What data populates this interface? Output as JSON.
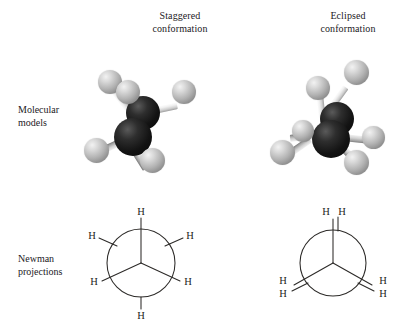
{
  "figure": {
    "title_staggered_line1": "Staggered",
    "title_staggered_line2": "conformation",
    "title_eclipsed_line1": "Eclipsed",
    "title_eclipsed_line2": "conformation",
    "row_label_models_line1": "Molecular",
    "row_label_models_line2": "models",
    "row_label_newman_line1": "Newman",
    "row_label_newman_line2": "projections",
    "background_color": "#ffffff",
    "text_color": "#23201e",
    "line_color": "#2c2a28",
    "carbon_color": "#131313",
    "hydrogen_color": "#b3b3b3"
  },
  "newman_staggered": {
    "front_h_labels": [
      "H",
      "H",
      "H"
    ],
    "back_h_labels": [
      "H",
      "H",
      "H"
    ],
    "h_top": "H",
    "h_upper_left": "H",
    "h_upper_right": "H",
    "h_lower_left": "H",
    "h_lower_right": "H",
    "h_bottom": "H",
    "dihedral_angle_deg": 60
  },
  "newman_eclipsed": {
    "h_top_left": "H",
    "h_top_right": "H",
    "h_left_upper": "H",
    "h_left_lower": "H",
    "h_right_upper": "H",
    "h_right_lower": "H",
    "dihedral_angle_deg": 0
  },
  "model_staggered": {
    "carbon_count": 2,
    "hydrogen_count": 6,
    "label": "ethane staggered ball-and-stick model"
  },
  "model_eclipsed": {
    "carbon_count": 2,
    "hydrogen_count": 6,
    "label": "ethane eclipsed ball-and-stick model"
  }
}
